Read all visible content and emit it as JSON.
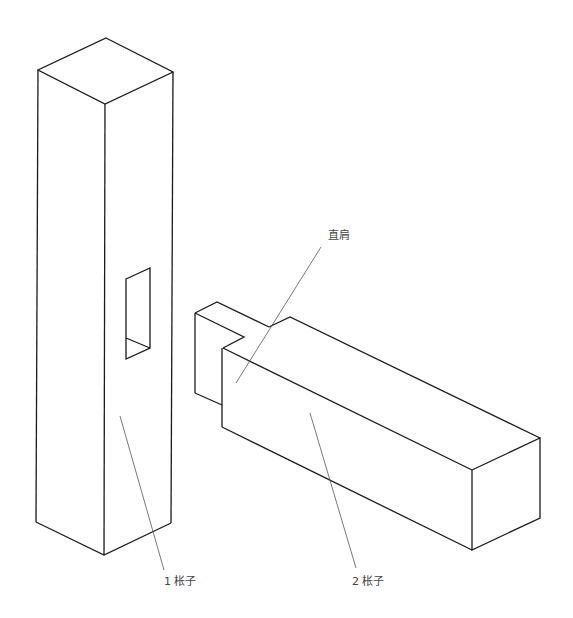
{
  "diagram": {
    "type": "isometric-joinery-drawing",
    "labels": {
      "post": "1 枨子",
      "rail": "2 枨子",
      "shoulder": "直肩"
    },
    "colors": {
      "line": "#1a1a1a",
      "leader": "#555555",
      "text": "#444444",
      "background": "#ffffff"
    }
  }
}
